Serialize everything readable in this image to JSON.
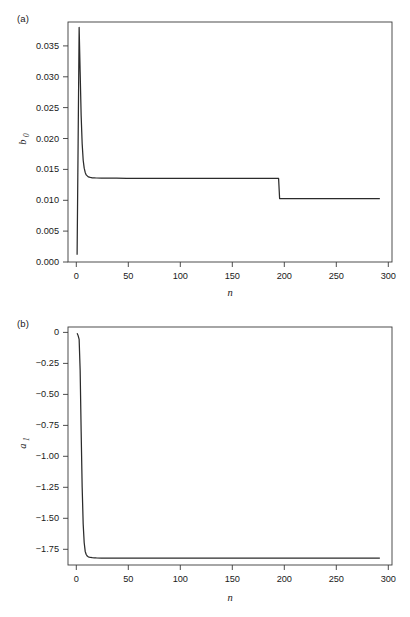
{
  "figure": {
    "background_color": "#ffffff",
    "line_color": "#2b2b2b",
    "axis_color": "#3a3a3a"
  },
  "panels": [
    {
      "id": "a",
      "label": "(a)",
      "xlabel": "n",
      "ylabel_base": "b",
      "ylabel_sub": "0"
    },
    {
      "id": "b",
      "label": "(b)",
      "xlabel": "n",
      "ylabel_base": "a",
      "ylabel_sub": "1"
    }
  ],
  "chart_data": [
    {
      "type": "line",
      "panel": "a",
      "title": "(a)",
      "xlabel": "n",
      "ylabel": "b_0",
      "xlim": [
        -8,
        312
      ],
      "ylim": [
        -0.0012,
        0.0382
      ],
      "grid": false,
      "legend": null,
      "xticks": [
        0,
        50,
        100,
        150,
        200,
        250,
        300
      ],
      "xticklabels": [
        "0",
        "50",
        "100",
        "150",
        "200",
        "250",
        "300"
      ],
      "yticks": [
        0.0,
        0.005,
        0.01,
        0.015,
        0.02,
        0.025,
        0.03,
        0.035
      ],
      "yticklabels": [
        "0.000",
        "0.005",
        "0.010",
        "0.015",
        "0.020",
        "0.025",
        "0.030",
        "0.035"
      ],
      "annotations": [
        "sharp spike to 0.0373 near n=3",
        "plateau at 0.0126 from n=12 to n=200",
        "step drop to 0.0092 at n=200"
      ],
      "series": [
        {
          "name": "b_0",
          "x": [
            1,
            2,
            3,
            4,
            5,
            6,
            7,
            8,
            9,
            10,
            12,
            14,
            16,
            18,
            20,
            25,
            30,
            40,
            50,
            60,
            80,
            100,
            120,
            140,
            160,
            180,
            195,
            199,
            200,
            201,
            205,
            210,
            220,
            240,
            260,
            280,
            300
          ],
          "values": [
            0.0,
            0.0186,
            0.0373,
            0.03,
            0.0228,
            0.0182,
            0.0155,
            0.0142,
            0.0135,
            0.0131,
            0.01278,
            0.01268,
            0.01263,
            0.01261,
            0.01259,
            0.01257,
            0.01256,
            0.01255,
            0.01254,
            0.01254,
            0.01253,
            0.01253,
            0.01253,
            0.01253,
            0.01252,
            0.01252,
            0.01252,
            0.01252,
            0.01252,
            0.00921,
            0.0092,
            0.0092,
            0.0092,
            0.0092,
            0.0092,
            0.0092,
            0.0092
          ]
        }
      ]
    },
    {
      "type": "line",
      "panel": "b",
      "title": "(b)",
      "xlabel": "n",
      "ylabel": "a_1",
      "xlim": [
        -8,
        312
      ],
      "ylim": [
        -1.88,
        0.05
      ],
      "grid": false,
      "legend": null,
      "xticks": [
        0,
        50,
        100,
        150,
        200,
        250,
        300
      ],
      "xticklabels": [
        "0",
        "50",
        "100",
        "150",
        "200",
        "250",
        "300"
      ],
      "yticks": [
        0.0,
        -0.25,
        -0.5,
        -0.75,
        -1.0,
        -1.25,
        -1.5,
        -1.75
      ],
      "yticklabels": [
        "0",
        "−0.25",
        "−0.50",
        "−0.75",
        "−1.00",
        "−1.25",
        "−1.50",
        "−1.75"
      ],
      "annotations": [
        "starts at 0 near n=1",
        "rapid monotonic decay",
        "plateau at about -1.82 from n=15 onward"
      ],
      "series": [
        {
          "name": "a_1",
          "x": [
            1,
            2,
            3,
            4,
            5,
            6,
            7,
            8,
            9,
            10,
            11,
            12,
            14,
            16,
            18,
            20,
            25,
            30,
            40,
            50,
            70,
            100,
            130,
            160,
            190,
            220,
            250,
            280,
            300
          ],
          "values": [
            0.0,
            -0.02,
            -0.05,
            -0.3,
            -0.8,
            -1.25,
            -1.55,
            -1.7,
            -1.77,
            -1.795,
            -1.808,
            -1.814,
            -1.819,
            -1.821,
            -1.822,
            -1.823,
            -1.824,
            -1.824,
            -1.825,
            -1.825,
            -1.825,
            -1.825,
            -1.825,
            -1.825,
            -1.825,
            -1.825,
            -1.825,
            -1.825,
            -1.825
          ]
        }
      ]
    }
  ]
}
